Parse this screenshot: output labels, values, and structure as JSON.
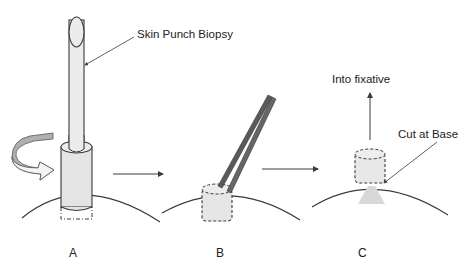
{
  "diagram": {
    "callouts": {
      "punch": "Skin Punch Biopsy",
      "fixative": "Into fixative",
      "cut": "Cut at Base"
    },
    "panels": [
      {
        "id": "A",
        "label": "A",
        "description": "Punch tool rotated into skin"
      },
      {
        "id": "B",
        "label": "B",
        "description": "Core lifted with forceps"
      },
      {
        "id": "C",
        "label": "C",
        "description": "Core cut at base, placed into fixative"
      }
    ],
    "colors": {
      "stroke": "#3a3a3a",
      "fill_light": "#e8e8e8",
      "forceps": "#5a5a5a",
      "rotation_arrow": "#a8a8a8",
      "text": "#222222"
    }
  }
}
